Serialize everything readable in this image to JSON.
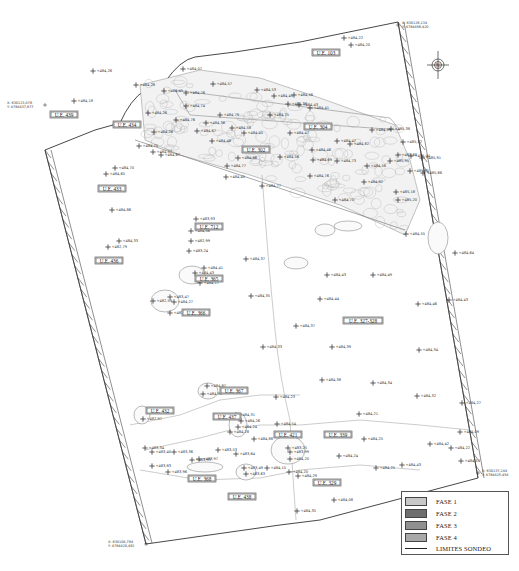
{
  "map": {
    "north_arrow": "compass-rose-north",
    "ue_labels": [
      {
        "id": "ue-103",
        "text": "U.E. 103",
        "x": 326,
        "y": 53
      },
      {
        "id": "ue-439",
        "text": "U.E. 439",
        "x": 64,
        "y": 115
      },
      {
        "id": "ue-434",
        "text": "U.E. 434",
        "x": 127,
        "y": 125
      },
      {
        "id": "ue-304",
        "text": "U.E. 304",
        "x": 318,
        "y": 127
      },
      {
        "id": "ue-302",
        "text": "U.E. 302",
        "x": 256,
        "y": 150
      },
      {
        "id": "ue-433",
        "text": "U.E. 433",
        "x": 112,
        "y": 189
      },
      {
        "id": "ue-712",
        "text": "U.E. 712",
        "x": 209,
        "y": 227
      },
      {
        "id": "ue-436",
        "text": "U.E. 436",
        "x": 109,
        "y": 261
      },
      {
        "id": "ue-365",
        "text": "U.E. 365",
        "x": 209,
        "y": 279
      },
      {
        "id": "ue-366",
        "text": "U.E. 366",
        "x": 196,
        "y": 313
      },
      {
        "id": "ue-327-328",
        "text": "U.E. 327-328",
        "x": 363,
        "y": 321
      },
      {
        "id": "ue-367",
        "text": "U.E. 367",
        "x": 234,
        "y": 391
      },
      {
        "id": "ue-432",
        "text": "U.E. 432",
        "x": 160,
        "y": 411
      },
      {
        "id": "ue-437",
        "text": "U.E. 437",
        "x": 227,
        "y": 417
      },
      {
        "id": "ue-421",
        "text": "U.E. 421",
        "x": 288,
        "y": 435
      },
      {
        "id": "ue-339",
        "text": "U.E. 339",
        "x": 338,
        "y": 435
      },
      {
        "id": "ue-368",
        "text": "U.E. 368",
        "x": 202,
        "y": 479
      },
      {
        "id": "ue-329",
        "text": "U.E. 329",
        "x": 327,
        "y": 483
      },
      {
        "id": "ue-438",
        "text": "U.E. 438",
        "x": 242,
        "y": 497
      }
    ],
    "coordinates": [
      {
        "id": "coord-ne",
        "x_line": "X: 630126,134",
        "y_line": "Y: 4764456,420",
        "px": 398,
        "py": 25
      },
      {
        "id": "coord-nw",
        "x_line": "X: 630123,076",
        "y_line": "Y: 4764437,677",
        "px": 45,
        "py": 105
      },
      {
        "id": "coord-se",
        "x_line": "X: 630137,244",
        "y_line": "Y: 4764425,454",
        "px": 478,
        "py": 473
      },
      {
        "id": "coord-sw",
        "x_line": "X: 630108,794",
        "y_line": "Y: 4764420,492",
        "px": 146,
        "py": 544
      }
    ],
    "points": [
      {
        "t": "484,22",
        "x": 344,
        "y": 38
      },
      {
        "t": "484,20",
        "x": 351,
        "y": 45
      },
      {
        "t": "484,26",
        "x": 93,
        "y": 71
      },
      {
        "t": "484,28",
        "x": 136,
        "y": 85
      },
      {
        "t": "484,07",
        "x": 183,
        "y": 69
      },
      {
        "t": "484,45",
        "x": 164,
        "y": 91
      },
      {
        "t": "484,76",
        "x": 186,
        "y": 93
      },
      {
        "t": "484,57",
        "x": 213,
        "y": 84
      },
      {
        "t": "484,53",
        "x": 257,
        "y": 90
      },
      {
        "t": "484,45",
        "x": 274,
        "y": 96
      },
      {
        "t": "484,56",
        "x": 294,
        "y": 95
      },
      {
        "t": "484,36",
        "x": 288,
        "y": 104
      },
      {
        "t": "484,43",
        "x": 299,
        "y": 105
      },
      {
        "t": "484,18",
        "x": 74,
        "y": 101
      },
      {
        "t": "484,26",
        "x": 148,
        "y": 113
      },
      {
        "t": "484,74",
        "x": 186,
        "y": 106
      },
      {
        "t": "484,79",
        "x": 220,
        "y": 115
      },
      {
        "t": "484,75",
        "x": 270,
        "y": 115
      },
      {
        "t": "484,41",
        "x": 310,
        "y": 108
      },
      {
        "t": "484,36",
        "x": 206,
        "y": 123
      },
      {
        "t": "484,67",
        "x": 197,
        "y": 131
      },
      {
        "t": "484,76",
        "x": 176,
        "y": 120
      },
      {
        "t": "484,45",
        "x": 244,
        "y": 133
      },
      {
        "t": "484,58",
        "x": 232,
        "y": 128
      },
      {
        "t": "484,47",
        "x": 290,
        "y": 133
      },
      {
        "t": "484,28",
        "x": 154,
        "y": 132
      },
      {
        "t": "484,75",
        "x": 139,
        "y": 146
      },
      {
        "t": "484,67",
        "x": 161,
        "y": 155
      },
      {
        "t": "484,57",
        "x": 153,
        "y": 152
      },
      {
        "t": "484,48",
        "x": 212,
        "y": 141
      },
      {
        "t": "484,86",
        "x": 238,
        "y": 158
      },
      {
        "t": "484,56",
        "x": 280,
        "y": 157
      },
      {
        "t": "484,46",
        "x": 312,
        "y": 150
      },
      {
        "t": "484,82",
        "x": 350,
        "y": 144
      },
      {
        "t": "484,47",
        "x": 337,
        "y": 141
      },
      {
        "t": "484,59",
        "x": 372,
        "y": 130
      },
      {
        "t": "485,38",
        "x": 391,
        "y": 129
      },
      {
        "t": "485,32",
        "x": 403,
        "y": 142
      },
      {
        "t": "484,70",
        "x": 115,
        "y": 168
      },
      {
        "t": "484,65",
        "x": 106,
        "y": 174
      },
      {
        "t": "484,77",
        "x": 227,
        "y": 166
      },
      {
        "t": "484,45",
        "x": 226,
        "y": 177
      },
      {
        "t": "484,77",
        "x": 262,
        "y": 186
      },
      {
        "t": "484,69",
        "x": 313,
        "y": 160
      },
      {
        "t": "484,73",
        "x": 337,
        "y": 161
      },
      {
        "t": "484,56",
        "x": 367,
        "y": 166
      },
      {
        "t": "485,95",
        "x": 390,
        "y": 161
      },
      {
        "t": "485,65",
        "x": 410,
        "y": 171
      },
      {
        "t": "485,66",
        "x": 423,
        "y": 173
      },
      {
        "t": "485,68",
        "x": 398,
        "y": 155
      },
      {
        "t": "485,44",
        "x": 411,
        "y": 156
      },
      {
        "t": "485,91",
        "x": 422,
        "y": 158
      },
      {
        "t": "484,76",
        "x": 310,
        "y": 176
      },
      {
        "t": "484,82",
        "x": 364,
        "y": 182
      },
      {
        "t": "485,18",
        "x": 396,
        "y": 192
      },
      {
        "t": "485,20",
        "x": 398,
        "y": 200
      },
      {
        "t": "484,70",
        "x": 335,
        "y": 200
      },
      {
        "t": "484,86",
        "x": 112,
        "y": 210
      },
      {
        "t": "483,93",
        "x": 196,
        "y": 219
      },
      {
        "t": "484,06",
        "x": 191,
        "y": 231
      },
      {
        "t": "482,99",
        "x": 191,
        "y": 241
      },
      {
        "t": "483,24",
        "x": 189,
        "y": 251
      },
      {
        "t": "484,33",
        "x": 119,
        "y": 241
      },
      {
        "t": "482,79",
        "x": 108,
        "y": 247
      },
      {
        "t": "484,55",
        "x": 406,
        "y": 234
      },
      {
        "t": "484,64",
        "x": 455,
        "y": 253
      },
      {
        "t": "484,37",
        "x": 246,
        "y": 259
      },
      {
        "t": "484,41",
        "x": 204,
        "y": 268
      },
      {
        "t": "484,43",
        "x": 195,
        "y": 273
      },
      {
        "t": "484,17",
        "x": 200,
        "y": 283
      },
      {
        "t": "484,43",
        "x": 327,
        "y": 275
      },
      {
        "t": "484,49",
        "x": 373,
        "y": 275
      },
      {
        "t": "483,47",
        "x": 170,
        "y": 297
      },
      {
        "t": "482,59",
        "x": 153,
        "y": 301
      },
      {
        "t": "484,27",
        "x": 174,
        "y": 302
      },
      {
        "t": "483,23",
        "x": 170,
        "y": 313
      },
      {
        "t": "484,35",
        "x": 251,
        "y": 296
      },
      {
        "t": "484,44",
        "x": 320,
        "y": 299
      },
      {
        "t": "484,46",
        "x": 418,
        "y": 304
      },
      {
        "t": "484,43",
        "x": 449,
        "y": 300
      },
      {
        "t": "484,37",
        "x": 296,
        "y": 326
      },
      {
        "t": "484,33",
        "x": 263,
        "y": 347
      },
      {
        "t": "484,39",
        "x": 332,
        "y": 347
      },
      {
        "t": "484,34",
        "x": 419,
        "y": 350
      },
      {
        "t": "484,38",
        "x": 322,
        "y": 380
      },
      {
        "t": "484,34",
        "x": 373,
        "y": 383
      },
      {
        "t": "484,87",
        "x": 207,
        "y": 386
      },
      {
        "t": "484,89",
        "x": 203,
        "y": 394
      },
      {
        "t": "484,23",
        "x": 276,
        "y": 397
      },
      {
        "t": "484,32",
        "x": 417,
        "y": 396
      },
      {
        "t": "484,27",
        "x": 462,
        "y": 403
      },
      {
        "t": "482,97",
        "x": 143,
        "y": 419
      },
      {
        "t": "484,31",
        "x": 236,
        "y": 415
      },
      {
        "t": "484,26",
        "x": 241,
        "y": 421
      },
      {
        "t": "484,24",
        "x": 238,
        "y": 427
      },
      {
        "t": "484,28",
        "x": 230,
        "y": 432
      },
      {
        "t": "484,88",
        "x": 254,
        "y": 439
      },
      {
        "t": "484,54",
        "x": 277,
        "y": 424
      },
      {
        "t": "484,21",
        "x": 359,
        "y": 414
      },
      {
        "t": "484,09",
        "x": 460,
        "y": 432
      },
      {
        "t": "484,42",
        "x": 430,
        "y": 444
      },
      {
        "t": "484,22",
        "x": 451,
        "y": 448
      },
      {
        "t": "484,57",
        "x": 461,
        "y": 461
      },
      {
        "t": "484,25",
        "x": 364,
        "y": 439
      },
      {
        "t": "484,24",
        "x": 339,
        "y": 456
      },
      {
        "t": "484,25",
        "x": 376,
        "y": 468
      },
      {
        "t": "484,43",
        "x": 402,
        "y": 465
      },
      {
        "t": "483,34",
        "x": 145,
        "y": 448
      },
      {
        "t": "483,40",
        "x": 152,
        "y": 452
      },
      {
        "t": "483,36",
        "x": 174,
        "y": 452
      },
      {
        "t": "483,53",
        "x": 218,
        "y": 450
      },
      {
        "t": "483,64",
        "x": 236,
        "y": 454
      },
      {
        "t": "483,93",
        "x": 192,
        "y": 460
      },
      {
        "t": "483,97",
        "x": 199,
        "y": 459
      },
      {
        "t": "483,25",
        "x": 288,
        "y": 448
      },
      {
        "t": "483,99",
        "x": 290,
        "y": 452
      },
      {
        "t": "484,20",
        "x": 290,
        "y": 459
      },
      {
        "t": "483,83",
        "x": 152,
        "y": 466
      },
      {
        "t": "483,96",
        "x": 168,
        "y": 472
      },
      {
        "t": "483,49",
        "x": 244,
        "y": 468
      },
      {
        "t": "483,63",
        "x": 246,
        "y": 474
      },
      {
        "t": "484,15",
        "x": 267,
        "y": 468
      },
      {
        "t": "484,20",
        "x": 289,
        "y": 472
      },
      {
        "t": "484,29",
        "x": 298,
        "y": 476
      },
      {
        "t": "484,35",
        "x": 297,
        "y": 511
      },
      {
        "t": "484,08",
        "x": 334,
        "y": 500
      }
    ]
  },
  "legend": {
    "items": [
      {
        "label": "FASE 1",
        "color": "#c8c8c8"
      },
      {
        "label": "FASE 2",
        "color": "#6e6e6e"
      },
      {
        "label": "FASE 3",
        "color": "#909090"
      },
      {
        "label": "FASE 4",
        "color": "#a8a8a8"
      }
    ],
    "line_label": "LIMITES SONDEO"
  }
}
